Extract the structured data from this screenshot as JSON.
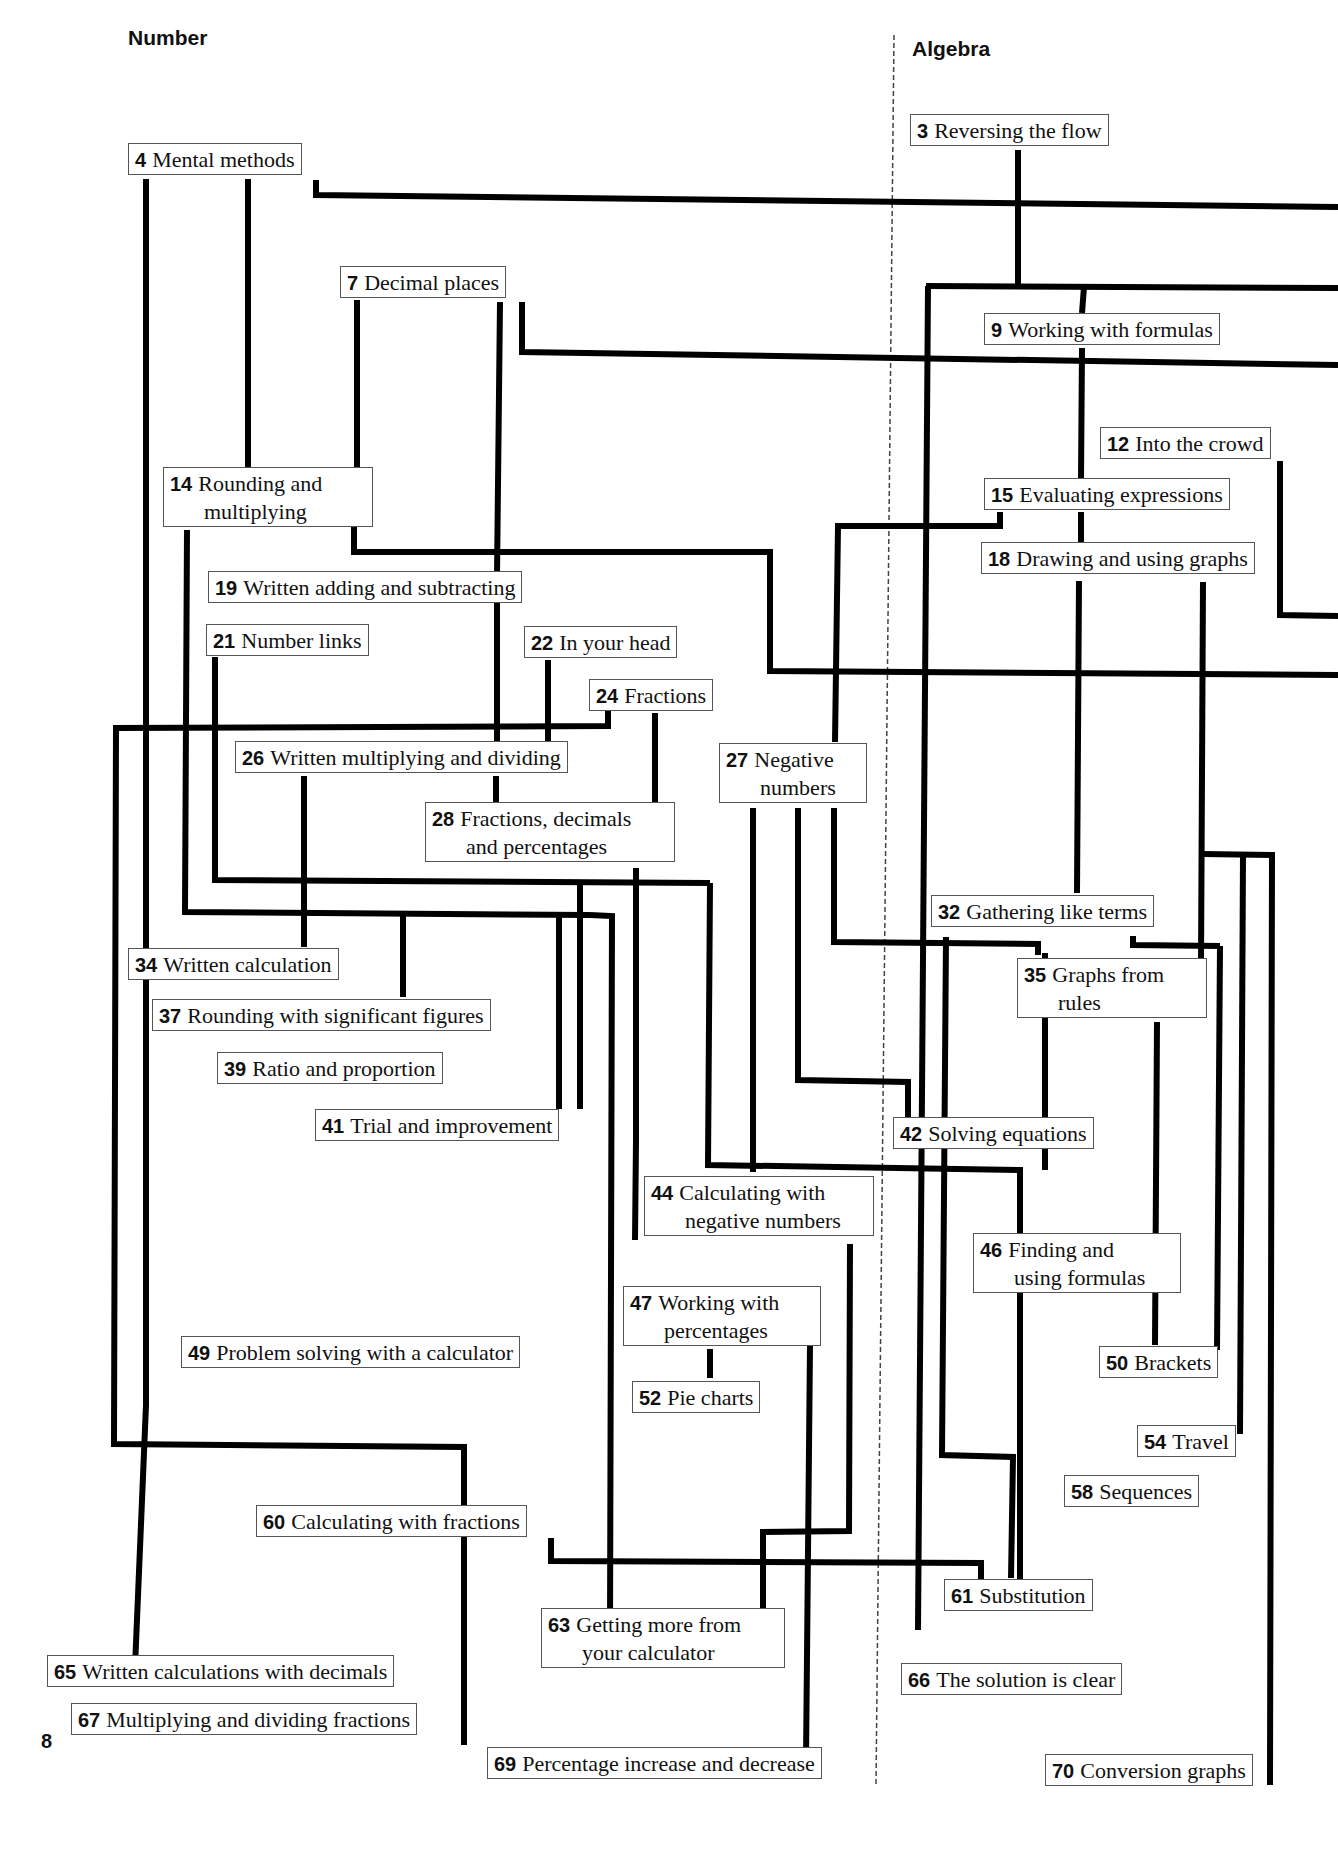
{
  "sections": {
    "left": "Number",
    "right": "Algebra"
  },
  "page_number": "8",
  "colors": {
    "line": "#000000",
    "box_border": "#555555",
    "divider": "#444444",
    "background": "#ffffff"
  },
  "nodes": [
    {
      "id": "n3",
      "num": "3",
      "line1": "Reversing the flow",
      "line2": ""
    },
    {
      "id": "n4",
      "num": "4",
      "line1": "Mental methods",
      "line2": ""
    },
    {
      "id": "n7",
      "num": "7",
      "line1": "Decimal places",
      "line2": ""
    },
    {
      "id": "n9",
      "num": "9",
      "line1": "Working with formulas",
      "line2": ""
    },
    {
      "id": "n12",
      "num": "12",
      "line1": "Into the crowd",
      "line2": ""
    },
    {
      "id": "n14",
      "num": "14",
      "line1": "Rounding and",
      "line2": "multiplying"
    },
    {
      "id": "n15",
      "num": "15",
      "line1": "Evaluating expressions",
      "line2": ""
    },
    {
      "id": "n18",
      "num": "18",
      "line1": "Drawing and using graphs",
      "line2": ""
    },
    {
      "id": "n19",
      "num": "19",
      "line1": "Written adding and subtracting",
      "line2": ""
    },
    {
      "id": "n21",
      "num": "21",
      "line1": "Number links",
      "line2": ""
    },
    {
      "id": "n22",
      "num": "22",
      "line1": "In your head",
      "line2": ""
    },
    {
      "id": "n24",
      "num": "24",
      "line1": "Fractions",
      "line2": ""
    },
    {
      "id": "n26",
      "num": "26",
      "line1": "Written multiplying and dividing",
      "line2": ""
    },
    {
      "id": "n27",
      "num": "27",
      "line1": "Negative",
      "line2": "numbers"
    },
    {
      "id": "n28",
      "num": "28",
      "line1": "Fractions, decimals",
      "line2": "and percentages"
    },
    {
      "id": "n32",
      "num": "32",
      "line1": "Gathering like terms",
      "line2": ""
    },
    {
      "id": "n34",
      "num": "34",
      "line1": "Written calculation",
      "line2": ""
    },
    {
      "id": "n35",
      "num": "35",
      "line1": "Graphs from",
      "line2": "rules"
    },
    {
      "id": "n37",
      "num": "37",
      "line1": "Rounding with significant figures",
      "line2": ""
    },
    {
      "id": "n39",
      "num": "39",
      "line1": "Ratio and proportion",
      "line2": ""
    },
    {
      "id": "n41",
      "num": "41",
      "line1": "Trial and improvement",
      "line2": ""
    },
    {
      "id": "n42",
      "num": "42",
      "line1": "Solving equations",
      "line2": ""
    },
    {
      "id": "n44",
      "num": "44",
      "line1": "Calculating with",
      "line2": "negative numbers"
    },
    {
      "id": "n46",
      "num": "46",
      "line1": "Finding and",
      "line2": "using formulas"
    },
    {
      "id": "n47",
      "num": "47",
      "line1": "Working with",
      "line2": "percentages"
    },
    {
      "id": "n49",
      "num": "49",
      "line1": "Problem solving with a calculator",
      "line2": ""
    },
    {
      "id": "n50",
      "num": "50",
      "line1": "Brackets",
      "line2": ""
    },
    {
      "id": "n52",
      "num": "52",
      "line1": "Pie charts",
      "line2": ""
    },
    {
      "id": "n54",
      "num": "54",
      "line1": "Travel",
      "line2": ""
    },
    {
      "id": "n58",
      "num": "58",
      "line1": "Sequences",
      "line2": ""
    },
    {
      "id": "n60",
      "num": "60",
      "line1": "Calculating with fractions",
      "line2": ""
    },
    {
      "id": "n61",
      "num": "61",
      "line1": "Substitution",
      "line2": ""
    },
    {
      "id": "n63",
      "num": "63",
      "line1": "Getting more from",
      "line2": "your calculator"
    },
    {
      "id": "n65",
      "num": "65",
      "line1": "Written calculations with decimals",
      "line2": ""
    },
    {
      "id": "n66",
      "num": "66",
      "line1": "The solution is clear",
      "line2": ""
    },
    {
      "id": "n67",
      "num": "67",
      "line1": "Multiplying and dividing fractions",
      "line2": ""
    },
    {
      "id": "n69",
      "num": "69",
      "line1": "Percentage increase and decrease",
      "line2": ""
    },
    {
      "id": "n70",
      "num": "70",
      "line1": "Conversion graphs",
      "line2": ""
    }
  ]
}
